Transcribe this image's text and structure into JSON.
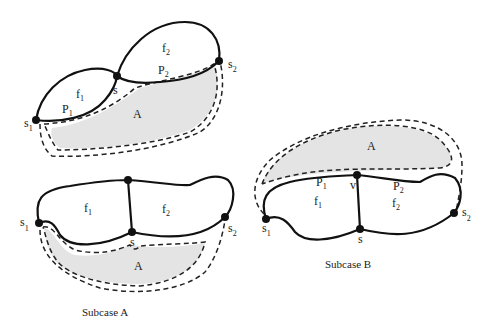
{
  "figure": {
    "top_diagram": {
      "faces": [
        {
          "name": "f",
          "sub": "1"
        },
        {
          "name": "f",
          "sub": "2"
        }
      ],
      "paths": [
        {
          "name": "P",
          "sub": "1"
        },
        {
          "name": "P",
          "sub": "2"
        }
      ],
      "nodes": {
        "s1": {
          "name": "s",
          "sub": "1"
        },
        "s": {
          "name": "s",
          "sub": ""
        },
        "s2": {
          "name": "s",
          "sub": "2"
        }
      },
      "region_label": "A"
    },
    "subcase_a": {
      "caption": "Subcase A",
      "faces": [
        {
          "name": "f",
          "sub": "1"
        },
        {
          "name": "f",
          "sub": "2"
        }
      ],
      "nodes": {
        "s1": {
          "name": "s",
          "sub": "1"
        },
        "s": {
          "name": "s",
          "sub": ""
        },
        "s2": {
          "name": "s",
          "sub": "2"
        }
      },
      "region_label": "A"
    },
    "subcase_b": {
      "caption": "Subcase B",
      "faces": [
        {
          "name": "f",
          "sub": "1"
        },
        {
          "name": "f",
          "sub": "2"
        }
      ],
      "paths": [
        {
          "name": "P",
          "sub": "1"
        },
        {
          "name": "P",
          "sub": "2"
        }
      ],
      "nodes": {
        "s1": {
          "name": "s",
          "sub": "1"
        },
        "v": {
          "name": "v",
          "sub": ""
        },
        "s": {
          "name": "s",
          "sub": ""
        },
        "s2": {
          "name": "s",
          "sub": "2"
        }
      },
      "region_label": "A"
    },
    "colors": {
      "stroke": "#111111",
      "region_fill": "#e4e4e4",
      "background": "#ffffff"
    }
  }
}
